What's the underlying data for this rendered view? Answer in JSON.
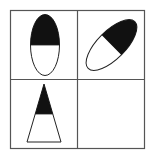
{
  "puzzle": {
    "grid": {
      "rows": 2,
      "cols": 2,
      "line_color": "#555555"
    },
    "cells": [
      {
        "position": "top-left",
        "shape": "ellipse",
        "orientation": "vertical",
        "filled_part": "top-half"
      },
      {
        "position": "top-right",
        "shape": "ellipse",
        "orientation": "tilted-45",
        "filled_part": "upper-right-half"
      },
      {
        "position": "bottom-left",
        "shape": "triangle",
        "orientation": "apex-up",
        "filled_part": "top-portion"
      },
      {
        "position": "bottom-right",
        "shape": "empty",
        "orientation": "",
        "filled_part": ""
      }
    ],
    "colors": {
      "fill": "#111111",
      "stroke": "#222222",
      "background": "#ffffff"
    }
  }
}
